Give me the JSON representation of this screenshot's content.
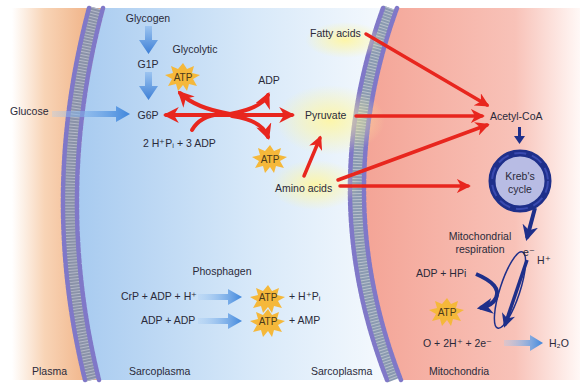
{
  "colors": {
    "plasma": "#f0b48a",
    "sarcoplasma": "#bcd8f4",
    "mitochondria": "#f4a89a",
    "red_arrow": "#e8261e",
    "blue_arrow": "#5a9ae0",
    "dark_blue": "#1e2f8a",
    "atp_star": "#f5b83a",
    "membrane": "#7c7ac8"
  },
  "regions": {
    "plasma": "Plasma",
    "sarcoplasma_left": "Sarcoplasma",
    "sarcoplasma_right": "Sarcoplasma",
    "mitochondria": "Mitochondria"
  },
  "glycolytic": {
    "title": "Glycolytic",
    "glycogen": "Glycogen",
    "g1p": "G1P",
    "g6p": "G6P",
    "glucose": "Glucose",
    "atp_top": "ATP",
    "adp": "ADP",
    "atp_bottom": "ATP",
    "input": "2 H⁺Pᵢ + 3 ADP",
    "pyruvate": "Pyruvate",
    "amino_acids": "Amino acids"
  },
  "oxidative": {
    "fatty_acids": "Fatty acids",
    "acetyl_coa": "Acetyl-CoA",
    "krebs_line1": "Kreb's",
    "krebs_line2": "cycle",
    "resp_line1": "Mitochondrial",
    "resp_line2": "respiration",
    "electron": "e⁻",
    "proton": "H⁺",
    "adp_hpi": "ADP + HPi",
    "atp": "ATP",
    "reaction": "O + 2H⁺ + 2e⁻",
    "water": "H₂O"
  },
  "phosphagen": {
    "title": "Phosphagen",
    "row1_left": "CrP + ADP + H⁺",
    "row1_atp": "ATP",
    "row1_right": "+ H⁺Pᵢ",
    "row2_left": "ADP + ADP",
    "row2_atp": "ATP",
    "row2_right": "+ AMP"
  }
}
